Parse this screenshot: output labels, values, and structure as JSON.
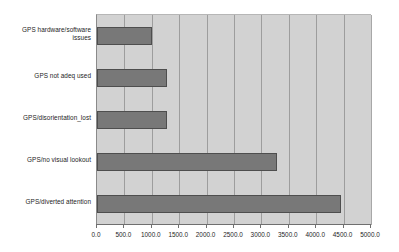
{
  "chart_data": {
    "type": "bar",
    "orientation": "horizontal",
    "title": "",
    "subtitle": "",
    "xlabel": "",
    "ylabel": "",
    "categories": [
      "GPS hardware/software issues",
      "GPS not adeq used",
      "GPS/disorientation_lost",
      "GPS/no visual lookout",
      "GPS/diverted attention"
    ],
    "category_lines": [
      [
        "GPS hardware/software",
        "issues"
      ],
      [
        "GPS not adeq used"
      ],
      [
        "GPS/disorientation_lost"
      ],
      [
        "GPS/no visual lookout"
      ],
      [
        "GPS/diverted attention"
      ]
    ],
    "values": [
      1000,
      1280,
      1280,
      3290,
      4460
    ],
    "xlim": [
      0,
      5000
    ],
    "xticks": [
      0,
      500,
      1000,
      1500,
      2000,
      2500,
      3000,
      3500,
      4000,
      4500,
      5000
    ],
    "xtick_labels": [
      "0.0",
      "500.0",
      "1000.0",
      "1500.0",
      "2000.0",
      "2500.0",
      "3000.0",
      "3500.0",
      "4000.0",
      "4500.0",
      "5000.0"
    ],
    "grid": true,
    "grid_axis": "x",
    "legend": false,
    "legend_position": "none",
    "colors": {
      "bar_fill": "#787878",
      "bar_border": "#4e4e4e",
      "plot_background": "#d2d2d2",
      "gridline": "#9d9d9d",
      "axis_line": "#6f6f6f",
      "page_background": "#ffffff",
      "text": "#1d1d1d"
    }
  }
}
